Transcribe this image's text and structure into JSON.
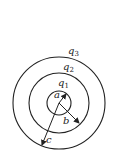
{
  "diagram": {
    "type": "concentric spherical shells with charges",
    "center": [
      59,
      103
    ],
    "stroke_color": "#222222",
    "shells": [
      {
        "charge_label": "q",
        "charge_sub": "1",
        "radius_label": "a",
        "radius": 12
      },
      {
        "charge_label": "q",
        "charge_sub": "2",
        "radius_label": "b",
        "radius": 30
      },
      {
        "charge_label": "q",
        "charge_sub": "3",
        "radius_label": "c",
        "radius": 46
      }
    ]
  }
}
